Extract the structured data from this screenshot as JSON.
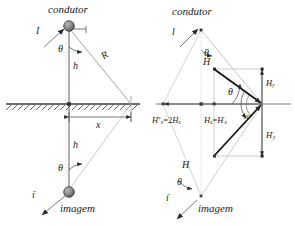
{
  "figure": {
    "colors": {
      "line": "#3c3c3c",
      "faint": "#b9b9b9",
      "bold": "#111111",
      "conductor_fill": "#7a7a7a",
      "text": "#1a1a1a"
    }
  },
  "left_diagram": {
    "name": "conductor-and-image",
    "conductor_label": "condutor",
    "image_label": "imagem",
    "current_label": "I",
    "image_current_label": "i",
    "image_current_prime": "'",
    "height_label": "h",
    "image_height_label": "h",
    "distance_label": "R",
    "horizontal_label": "x",
    "angle_label": "θ",
    "image_angle_label": "θ"
  },
  "right_diagram": {
    "name": "field-vector-decomposition",
    "conductor_label": "condutor",
    "image_label": "imagem",
    "current_label": "l",
    "image_current_label": "i",
    "image_current_prime": "'",
    "field_label": "H",
    "image_field_label": "H",
    "angle_label": "θ",
    "image_angle_label": "θ",
    "right_angle_label": "90°",
    "hy_label": "H",
    "hy_sub": "y",
    "hy_prime_label": "H",
    "hy_prime_sub": "y",
    "hy_prime_mark": "'",
    "eq_left": {
      "sym": "H",
      "sup": "*",
      "sub": "x",
      "eq": "=",
      "rhs_coef": "2",
      "rhs_sym": "H",
      "rhs_sub": "x"
    },
    "eq_right": {
      "sym": "H",
      "sub": "x",
      "eq": "=",
      "rhs_sym": "H",
      "rhs_prime": "'",
      "rhs_sub": "x"
    }
  }
}
